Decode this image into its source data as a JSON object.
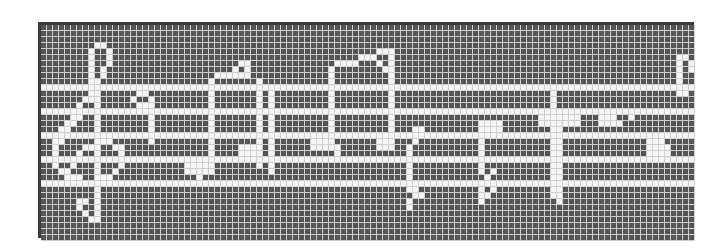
{
  "image": {
    "description": "Pixel-grid rendering of a line of music notation (treble clef, staff and notes) on a dark square grid",
    "grid": {
      "cols": 109,
      "rows": 36,
      "cell_px": 6
    },
    "colors": {
      "background": "#555555",
      "pixel_on": "#f4f4f4",
      "grid_line": "#cfcfcf",
      "frame": "#3a3a3a",
      "page": "#ffffff"
    },
    "staff_rows": [
      10,
      14,
      18,
      22,
      26
    ],
    "shapes": [
      {
        "name": "treble-clef",
        "cells": [
          [
            3,
            9
          ],
          [
            3,
            10
          ],
          [
            4,
            8
          ],
          [
            4,
            11
          ],
          [
            5,
            8
          ],
          [
            5,
            11
          ],
          [
            6,
            8
          ],
          [
            6,
            11
          ],
          [
            7,
            8
          ],
          [
            7,
            10
          ],
          [
            8,
            8
          ],
          [
            8,
            10
          ],
          [
            9,
            8
          ],
          [
            9,
            9
          ],
          [
            11,
            8
          ],
          [
            11,
            9
          ],
          [
            12,
            7
          ],
          [
            12,
            8
          ],
          [
            12,
            9
          ],
          [
            13,
            6
          ],
          [
            13,
            9
          ],
          [
            15,
            5
          ],
          [
            15,
            6
          ],
          [
            15,
            9
          ],
          [
            16,
            4
          ],
          [
            16,
            5
          ],
          [
            16,
            9
          ],
          [
            17,
            3
          ],
          [
            17,
            4
          ],
          [
            17,
            9
          ],
          [
            19,
            2
          ],
          [
            19,
            3
          ],
          [
            19,
            9
          ],
          [
            19,
            10
          ],
          [
            19,
            11
          ],
          [
            20,
            2
          ],
          [
            20,
            7
          ],
          [
            20,
            8
          ],
          [
            20,
            9
          ],
          [
            20,
            12
          ],
          [
            20,
            13
          ],
          [
            21,
            2
          ],
          [
            21,
            6
          ],
          [
            21,
            9
          ],
          [
            21,
            13
          ],
          [
            23,
            2
          ],
          [
            23,
            5
          ],
          [
            23,
            9
          ],
          [
            23,
            13
          ],
          [
            24,
            3
          ],
          [
            24,
            4
          ],
          [
            24,
            9
          ],
          [
            24,
            12
          ],
          [
            25,
            4
          ],
          [
            25,
            5
          ],
          [
            25,
            6
          ],
          [
            25,
            9
          ],
          [
            25,
            10
          ],
          [
            25,
            11
          ],
          [
            27,
            9
          ],
          [
            28,
            9
          ],
          [
            29,
            6
          ],
          [
            29,
            7
          ],
          [
            29,
            9
          ],
          [
            30,
            6
          ],
          [
            30,
            9
          ],
          [
            31,
            7
          ],
          [
            31,
            9
          ],
          [
            32,
            8
          ],
          [
            32,
            9
          ]
        ]
      },
      {
        "name": "note-1",
        "cells": [
          [
            11,
            16
          ],
          [
            11,
            17
          ],
          [
            12,
            15
          ],
          [
            12,
            18
          ],
          [
            13,
            16
          ],
          [
            13,
            17
          ],
          [
            13,
            18
          ],
          [
            15,
            18
          ],
          [
            16,
            18
          ],
          [
            17,
            18
          ],
          [
            19,
            18
          ]
        ]
      },
      {
        "name": "beamed-pair-1",
        "cells": [
          [
            6,
            33
          ],
          [
            6,
            34
          ],
          [
            7,
            32
          ],
          [
            7,
            34
          ],
          [
            8,
            29
          ],
          [
            8,
            30
          ],
          [
            8,
            31
          ],
          [
            8,
            32
          ],
          [
            8,
            33
          ],
          [
            8,
            34
          ],
          [
            9,
            28
          ],
          [
            11,
            28
          ],
          [
            12,
            28
          ],
          [
            13,
            28
          ],
          [
            15,
            28
          ],
          [
            16,
            28
          ],
          [
            17,
            28
          ],
          [
            19,
            28
          ],
          [
            20,
            28
          ],
          [
            21,
            28
          ],
          [
            23,
            24
          ],
          [
            23,
            25
          ],
          [
            23,
            26
          ],
          [
            23,
            27
          ],
          [
            23,
            28
          ],
          [
            24,
            24
          ],
          [
            24,
            25
          ],
          [
            24,
            26
          ],
          [
            24,
            27
          ],
          [
            24,
            28
          ],
          [
            25,
            26
          ],
          [
            9,
            36
          ],
          [
            11,
            36
          ],
          [
            12,
            36
          ],
          [
            13,
            36
          ],
          [
            15,
            36
          ],
          [
            16,
            36
          ],
          [
            17,
            36
          ],
          [
            19,
            36
          ],
          [
            20,
            33
          ],
          [
            20,
            34
          ],
          [
            20,
            35
          ],
          [
            20,
            36
          ],
          [
            21,
            33
          ],
          [
            21,
            34
          ],
          [
            21,
            35
          ],
          [
            21,
            36
          ],
          [
            23,
            36
          ],
          [
            11,
            38
          ],
          [
            12,
            38
          ],
          [
            13,
            38
          ],
          [
            15,
            38
          ],
          [
            16,
            38
          ],
          [
            17,
            38
          ],
          [
            19,
            38
          ],
          [
            20,
            38
          ],
          [
            21,
            38
          ],
          [
            23,
            38
          ],
          [
            24,
            38
          ]
        ]
      },
      {
        "name": "beamed-pair-2",
        "cells": [
          [
            4,
            56
          ],
          [
            4,
            57
          ],
          [
            4,
            58
          ],
          [
            5,
            53
          ],
          [
            5,
            54
          ],
          [
            5,
            55
          ],
          [
            5,
            58
          ],
          [
            6,
            49
          ],
          [
            6,
            50
          ],
          [
            6,
            51
          ],
          [
            6,
            52
          ],
          [
            6,
            56
          ],
          [
            6,
            58
          ],
          [
            7,
            48
          ],
          [
            7,
            57
          ],
          [
            7,
            58
          ],
          [
            8,
            48
          ],
          [
            8,
            58
          ],
          [
            9,
            48
          ],
          [
            9,
            58
          ],
          [
            11,
            48
          ],
          [
            11,
            58
          ],
          [
            12,
            48
          ],
          [
            12,
            58
          ],
          [
            13,
            48
          ],
          [
            13,
            58
          ],
          [
            15,
            48
          ],
          [
            15,
            58
          ],
          [
            16,
            48
          ],
          [
            16,
            58
          ],
          [
            17,
            48
          ],
          [
            17,
            58
          ],
          [
            19,
            45
          ],
          [
            19,
            46
          ],
          [
            19,
            47
          ],
          [
            19,
            48
          ],
          [
            19,
            56
          ],
          [
            19,
            57
          ],
          [
            19,
            58
          ],
          [
            20,
            45
          ],
          [
            20,
            46
          ],
          [
            20,
            47
          ],
          [
            20,
            48
          ],
          [
            20,
            49
          ],
          [
            20,
            56
          ],
          [
            20,
            57
          ],
          [
            20,
            58
          ],
          [
            21,
            49
          ]
        ]
      },
      {
        "name": "note-2",
        "cells": [
          [
            17,
            62
          ],
          [
            17,
            63
          ],
          [
            19,
            62
          ],
          [
            20,
            61
          ],
          [
            21,
            61
          ],
          [
            23,
            61
          ],
          [
            24,
            61
          ],
          [
            25,
            61
          ],
          [
            27,
            61
          ],
          [
            27,
            62
          ],
          [
            28,
            62
          ],
          [
            28,
            63
          ],
          [
            29,
            61
          ],
          [
            30,
            61
          ]
        ]
      },
      {
        "name": "note-3",
        "cells": [
          [
            16,
            73
          ],
          [
            16,
            74
          ],
          [
            16,
            75
          ],
          [
            16,
            76
          ],
          [
            17,
            73
          ],
          [
            17,
            74
          ],
          [
            17,
            75
          ],
          [
            17,
            76
          ],
          [
            19,
            73
          ],
          [
            20,
            73
          ],
          [
            21,
            73
          ],
          [
            23,
            73
          ],
          [
            24,
            73
          ],
          [
            24,
            75
          ],
          [
            25,
            74
          ],
          [
            27,
            73
          ],
          [
            27,
            75
          ],
          [
            28,
            73
          ],
          [
            28,
            74
          ],
          [
            29,
            73
          ]
        ]
      },
      {
        "name": "note-4",
        "cells": [
          [
            11,
            85
          ],
          [
            12,
            85
          ],
          [
            13,
            85
          ],
          [
            15,
            85
          ],
          [
            16,
            85
          ],
          [
            17,
            85
          ],
          [
            19,
            85
          ],
          [
            20,
            85
          ],
          [
            21,
            85
          ],
          [
            23,
            85
          ],
          [
            24,
            85
          ],
          [
            25,
            85
          ],
          [
            27,
            85
          ],
          [
            28,
            85
          ],
          [
            15,
            83
          ],
          [
            15,
            84
          ],
          [
            16,
            83
          ],
          [
            16,
            84
          ]
        ]
      },
      {
        "name": "note-5",
        "cells": [
          [
            15,
            86
          ],
          [
            15,
            87
          ],
          [
            15,
            88
          ],
          [
            15,
            89
          ],
          [
            16,
            86
          ],
          [
            16,
            87
          ],
          [
            16,
            88
          ],
          [
            16,
            89
          ],
          [
            17,
            86
          ],
          [
            19,
            86
          ],
          [
            20,
            86
          ],
          [
            21,
            86
          ],
          [
            23,
            86
          ],
          [
            24,
            86
          ],
          [
            25,
            86
          ],
          [
            27,
            86
          ],
          [
            28,
            86
          ],
          [
            29,
            86
          ]
        ]
      },
      {
        "name": "note-6",
        "cells": [
          [
            15,
            93
          ],
          [
            15,
            94
          ],
          [
            15,
            95
          ],
          [
            16,
            93
          ],
          [
            16,
            94
          ],
          [
            16,
            95
          ],
          [
            16,
            96
          ],
          [
            15,
            98
          ],
          [
            19,
            101
          ],
          [
            19,
            102
          ],
          [
            19,
            103
          ],
          [
            20,
            101
          ],
          [
            20,
            102
          ],
          [
            20,
            103
          ],
          [
            20,
            104
          ],
          [
            21,
            101
          ],
          [
            21,
            102
          ],
          [
            21,
            103
          ],
          [
            21,
            104
          ]
        ]
      },
      {
        "name": "clef-fragment-right",
        "cells": [
          [
            5,
            106
          ],
          [
            5,
            107
          ],
          [
            6,
            106
          ],
          [
            6,
            108
          ],
          [
            7,
            106
          ],
          [
            7,
            108
          ],
          [
            8,
            106
          ],
          [
            9,
            106
          ],
          [
            11,
            106
          ],
          [
            11,
            107
          ]
        ]
      }
    ]
  }
}
